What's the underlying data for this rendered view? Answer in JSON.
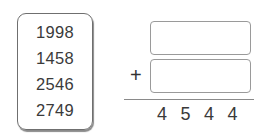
{
  "numbers": [
    "1998",
    "1458",
    "2546",
    "2749"
  ],
  "operator": "+",
  "answer_inputs": [
    {
      "value": "",
      "placeholder": ""
    },
    {
      "value": "",
      "placeholder": ""
    }
  ],
  "sum_digits": [
    "4",
    "5",
    "4",
    "4"
  ]
}
